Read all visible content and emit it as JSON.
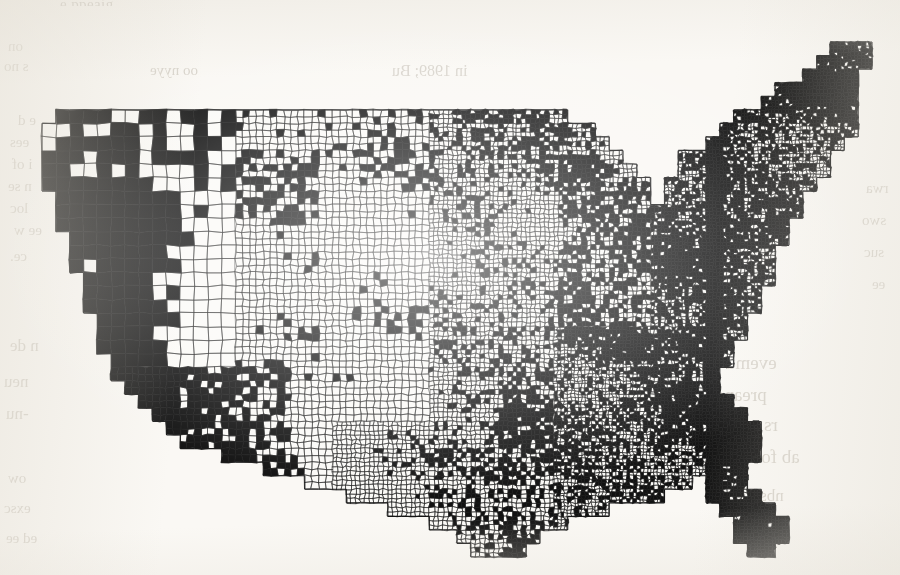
{
  "page": {
    "background_color": "#faf8f4",
    "ink_color": "#111111",
    "paper_type": "scanned-book-page",
    "bleed_through_note": "faint mirrored text from reverse page"
  },
  "figure": {
    "kind": "choropleth-map",
    "region": "contiguous-united-states",
    "unit": "county",
    "projection": "albers-equal-area-conic",
    "shading": "binary",
    "legend_visible": false,
    "title_visible": false,
    "axis_visible": false,
    "border_visible": false,
    "fill_true_color": "#111111",
    "fill_false_color": "#fbfaf7",
    "outline_color": "#1a1a1a"
  },
  "bleed_text": [
    {
      "id": "b1",
      "text": "on",
      "x": 8,
      "y": 38,
      "size": 15,
      "mirrored": true
    },
    {
      "id": "b2",
      "text": "s no",
      "x": 4,
      "y": 58,
      "size": 15,
      "mirrored": true
    },
    {
      "id": "b3",
      "text": "oo nyye",
      "x": 150,
      "y": 62,
      "size": 15,
      "mirrored": true
    },
    {
      "id": "b4",
      "text": "in 1989; Bu",
      "x": 392,
      "y": 62,
      "size": 16,
      "mirrored": true
    },
    {
      "id": "b5",
      "text": "e d",
      "x": 18,
      "y": 112,
      "size": 15,
      "mirrored": true
    },
    {
      "id": "b6",
      "text": "ees",
      "x": 10,
      "y": 134,
      "size": 15,
      "mirrored": true
    },
    {
      "id": "b7",
      "text": "i of",
      "x": 12,
      "y": 156,
      "size": 15,
      "mirrored": true
    },
    {
      "id": "b8",
      "text": "n se",
      "x": 8,
      "y": 178,
      "size": 15,
      "mirrored": true
    },
    {
      "id": "b9",
      "text": "loc",
      "x": 10,
      "y": 200,
      "size": 15,
      "mirrored": true
    },
    {
      "id": "b10",
      "text": "ee w",
      "x": 14,
      "y": 222,
      "size": 15,
      "mirrored": true
    },
    {
      "id": "b11",
      "text": "ce.",
      "x": 10,
      "y": 248,
      "size": 15,
      "mirrored": true
    },
    {
      "id": "b12",
      "text": "n de",
      "x": 10,
      "y": 336,
      "size": 17,
      "mirrored": true
    },
    {
      "id": "b13",
      "text": "neu",
      "x": 4,
      "y": 372,
      "size": 17,
      "mirrored": true
    },
    {
      "id": "b14",
      "text": "-nu",
      "x": 6,
      "y": 404,
      "size": 17,
      "mirrored": true
    },
    {
      "id": "b15",
      "text": "ow",
      "x": 8,
      "y": 470,
      "size": 15,
      "mirrored": true
    },
    {
      "id": "b16",
      "text": "exsc",
      "x": 4,
      "y": 500,
      "size": 15,
      "mirrored": true
    },
    {
      "id": "b17",
      "text": "ed ee",
      "x": 6,
      "y": 530,
      "size": 15,
      "mirrored": true
    },
    {
      "id": "b18",
      "text": "evemu",
      "x": 726,
      "y": 352,
      "size": 19,
      "mirrored": true
    },
    {
      "id": "b19",
      "text": "preanc",
      "x": 716,
      "y": 384,
      "size": 19,
      "mirrored": true
    },
    {
      "id": "b20",
      "text": "rs can sto",
      "x": 706,
      "y": 414,
      "size": 19,
      "mirrored": true
    },
    {
      "id": "b21",
      "text": "ab for aoa nu",
      "x": 700,
      "y": 446,
      "size": 19,
      "mirrored": true
    },
    {
      "id": "b22",
      "text": "nbs",
      "x": 760,
      "y": 486,
      "size": 17,
      "mirrored": true
    },
    {
      "id": "b23",
      "text": "rwa",
      "x": 866,
      "y": 180,
      "size": 15,
      "mirrored": true
    },
    {
      "id": "b24",
      "text": "swo",
      "x": 862,
      "y": 212,
      "size": 15,
      "mirrored": true
    },
    {
      "id": "b25",
      "text": "suc",
      "x": 864,
      "y": 244,
      "size": 15,
      "mirrored": true
    },
    {
      "id": "b26",
      "text": "ee",
      "x": 872,
      "y": 276,
      "size": 15,
      "mirrored": true
    }
  ],
  "cut_caption": {
    "text": "e ppeaig",
    "x": 60,
    "y": -4
  },
  "chart_data": {
    "type": "map",
    "subtype": "binary-choropleth",
    "title": "",
    "xlabel": "",
    "ylabel": "",
    "legend": [],
    "classes": [
      {
        "label": "shaded",
        "color": "#111111"
      },
      {
        "label": "unshaded",
        "color": "#fbfaf7"
      }
    ]
  }
}
